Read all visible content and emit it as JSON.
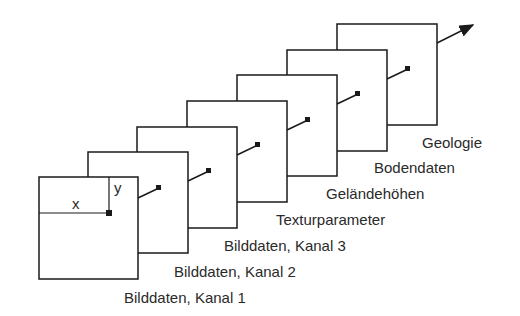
{
  "diagram": {
    "type": "layer-stack",
    "axes": {
      "x_label": "x",
      "y_label": "y"
    },
    "layers": [
      {
        "label": "Bilddaten, Kanal 1"
      },
      {
        "label": "Bilddaten, Kanal 2"
      },
      {
        "label": "Bilddaten, Kanal 3"
      },
      {
        "label": "Texturparameter"
      },
      {
        "label": "Geländehöhen"
      },
      {
        "label": "Bodendaten"
      },
      {
        "label": "Geologie"
      }
    ],
    "colors": {
      "line": "#1a1a1a",
      "background": "#ffffff"
    }
  }
}
